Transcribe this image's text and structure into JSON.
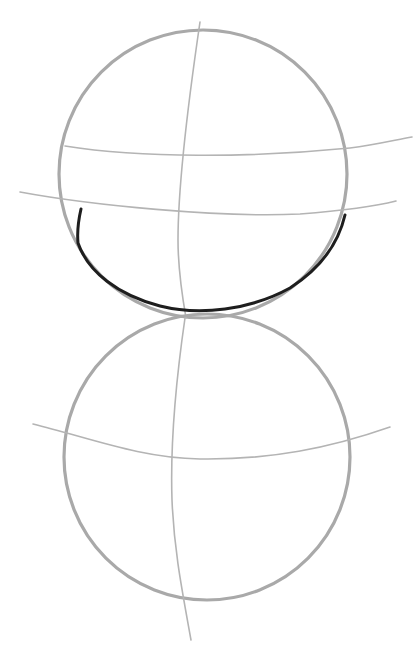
{
  "image": {
    "description": "Pencil sketch of two stacked circles with construction guide lines",
    "background": "#ffffff",
    "pencil_color": "#a9a9a9",
    "ink_color": "#1e1e1e"
  },
  "top_circle": {
    "cx": 203,
    "cy": 174,
    "r": 144
  },
  "bottom_circle": {
    "cx": 207,
    "cy": 457,
    "r": 143
  }
}
